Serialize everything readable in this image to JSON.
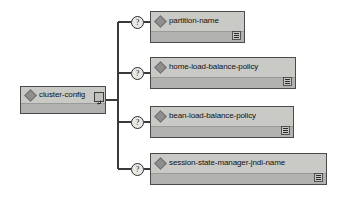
{
  "diagram": {
    "type": "xml-schema-tree",
    "root": {
      "label": "cluster-config",
      "element_icon": "diamond-icon",
      "expand_button_icon": "expand-collapse-icon",
      "x": 20,
      "y": 86,
      "width": 86,
      "height": 28
    },
    "children": [
      {
        "label": "partition-name",
        "occurrence": "?",
        "occurrence_title": "optional",
        "element_icon": "diamond-icon",
        "detail_icon": "sequence-list-icon",
        "x": 150,
        "y": 11,
        "width": 95,
        "height": 32,
        "connector_y": 22
      },
      {
        "label": "home-load-balance-policy",
        "occurrence": "?",
        "occurrence_title": "optional",
        "element_icon": "diamond-icon",
        "detail_icon": "sequence-list-icon",
        "x": 150,
        "y": 57,
        "width": 146,
        "height": 32,
        "connector_y": 73
      },
      {
        "label": "bean-load-balance-policy",
        "occurrence": "?",
        "occurrence_title": "optional",
        "element_icon": "diamond-icon",
        "detail_icon": "sequence-list-icon",
        "x": 150,
        "y": 106,
        "width": 144,
        "height": 32,
        "connector_y": 122
      },
      {
        "label": "session-state-manager-jndi-name",
        "occurrence": "?",
        "occurrence_title": "optional",
        "element_icon": "diamond-icon",
        "detail_icon": "sequence-list-icon",
        "x": 150,
        "y": 153,
        "width": 177,
        "height": 32,
        "connector_y": 169
      }
    ],
    "colors": {
      "background": "#ffffff",
      "box_border": "#4a4a4a",
      "box_top_fill": "#c9c9c6",
      "box_bottom_fill": "#b2b2b0",
      "connector_line": "#3a3a3a",
      "diamond_fill": "#8e8e8e",
      "text": "#111111"
    }
  }
}
